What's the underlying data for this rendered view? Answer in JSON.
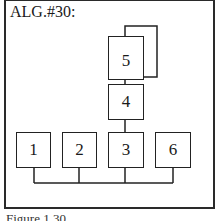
{
  "title": "ALG.#30:",
  "caption": "Figure 1.30",
  "nodes": [
    {
      "id": "5",
      "label": "5"
    },
    {
      "id": "4",
      "label": "4"
    },
    {
      "id": "1",
      "label": "1"
    },
    {
      "id": "2",
      "label": "2"
    },
    {
      "id": "3",
      "label": "3"
    },
    {
      "id": "6",
      "label": "6"
    }
  ],
  "edges": [
    {
      "from": "5",
      "to": "5",
      "type": "self-loop"
    },
    {
      "from": "5",
      "to": "4"
    },
    {
      "from": "4",
      "to": "3"
    },
    {
      "from": "1",
      "to": "bus"
    },
    {
      "from": "2",
      "to": "bus"
    },
    {
      "from": "3",
      "to": "bus"
    },
    {
      "from": "6",
      "to": "bus"
    }
  ]
}
